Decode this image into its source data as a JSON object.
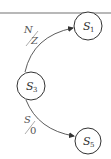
{
  "diagram": {
    "type": "state-transition",
    "top_rule_color": "#b8b8b8",
    "stroke_color": "#333333",
    "states": [
      {
        "id": "S1",
        "letter": "S",
        "sub": "1",
        "cx": 88,
        "cy": 26,
        "r": 14
      },
      {
        "id": "S3",
        "letter": "S",
        "sub": "3",
        "cx": 31,
        "cy": 86,
        "r": 14
      },
      {
        "id": "S5",
        "letter": "S",
        "sub": "5",
        "cx": 88,
        "cy": 141,
        "r": 13
      }
    ],
    "transitions": [
      {
        "from": "S3",
        "to": "S1",
        "input": "N",
        "output": "Z"
      },
      {
        "from": "S3",
        "to": "S5",
        "input": "S",
        "output": "0"
      }
    ]
  }
}
